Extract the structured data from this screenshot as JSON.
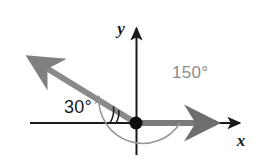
{
  "figure": {
    "background_color": "#ffffff",
    "origin": {
      "x": 136,
      "y": 123
    },
    "axes": {
      "x_axis": {
        "label": "x",
        "color": "#1a1a1a",
        "start_x": 30,
        "end_x": 247,
        "y": 123,
        "arrow_direction": "right"
      },
      "y_axis": {
        "label": "y",
        "color": "#1a1a1a",
        "x": 136,
        "start_y": 155,
        "end_y": 22,
        "arrow_direction": "up"
      }
    },
    "ray": {
      "name": "terminal-side",
      "color": "#808080",
      "angle_degrees": 150,
      "length": 132,
      "thickness": 6,
      "arrow_direction": "up-left",
      "tip": {
        "x": 22,
        "y": 52
      }
    },
    "initial_side": {
      "name": "initial-side",
      "color": "#707070",
      "angle_degrees": 0,
      "thickness": 6,
      "tip": {
        "x": 225,
        "y": 123
      }
    },
    "angles": [
      {
        "id": "angle-150",
        "value": "150°",
        "degrees": 150,
        "color": "#8c8c8c",
        "arc_radius": 44,
        "arc_start_degrees": 0,
        "arc_end_degrees": 150,
        "arc_has_arrowhead": true,
        "label_position": {
          "x": 172,
          "y": 78
        }
      },
      {
        "id": "angle-30",
        "value": "30°",
        "degrees": 30,
        "color": "#1a1a1a",
        "tick_marks": 2,
        "tick_radii": [
          20,
          26
        ],
        "label_position": {
          "x": 64,
          "y": 113
        }
      }
    ]
  }
}
